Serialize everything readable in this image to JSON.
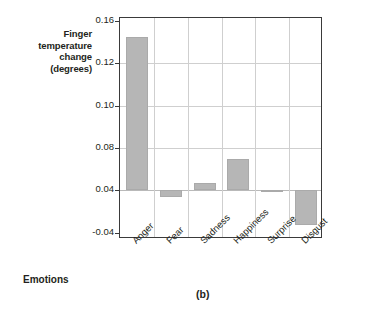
{
  "chart_data": {
    "type": "bar",
    "title": "",
    "panel_label": "(b)",
    "xlabel": "Emotions",
    "ylabel": "Finger temperature change (degrees)",
    "ylabel_lines": [
      "Finger",
      "temperature",
      "change",
      "(degrees)"
    ],
    "categories": [
      "Anger",
      "Fear",
      "Sadness",
      "Happiness",
      "Surprise",
      "Disgust"
    ],
    "values": [
      0.145,
      0.028,
      0.047,
      0.07,
      0.036,
      -0.025
    ],
    "baseline": 0.04,
    "ytick_labels": [
      "0.16",
      "0.12",
      "0.10",
      "0.08",
      "0.04",
      "-0.04"
    ],
    "ytick_values": [
      0.16,
      0.12,
      0.1,
      0.08,
      0.04,
      -0.04
    ],
    "ylim": [
      -0.04,
      0.16
    ],
    "grid": true,
    "legend": "none",
    "bar_color": "#b6b6b6",
    "grid_color": "#cfcfcf",
    "axis_color": "#3a3a3a"
  }
}
